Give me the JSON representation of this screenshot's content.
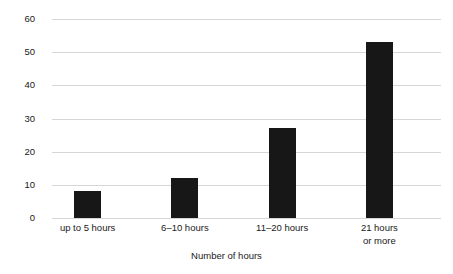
{
  "chart_data": {
    "type": "bar",
    "title": "",
    "subtitle": "",
    "xlabel": "Number of hours",
    "ylabel": "Percentage of students",
    "categories": [
      "up to 5 hours",
      "6–10 hours",
      "11–20 hours",
      "21 hours or more"
    ],
    "category_lines": [
      [
        "up to 5 hours"
      ],
      [
        "6–10 hours"
      ],
      [
        "11–20 hours"
      ],
      [
        "21 hours",
        "or more"
      ]
    ],
    "values": [
      8,
      12,
      27,
      53
    ],
    "ylim": [
      0,
      60
    ],
    "ytick_values": [
      0,
      10,
      20,
      30,
      40,
      50,
      60
    ],
    "ytick_labels": [
      "0",
      "10",
      "20",
      "30",
      "40",
      "50",
      "60"
    ],
    "grid": true,
    "grid_axis": "y",
    "legend": false,
    "legend_position": "none",
    "bar_color": "#171717",
    "gridline_color": "#d6d6d6",
    "background_color": "#ffffff",
    "text_color": "#1a1a1a",
    "data_labels_shown": false,
    "axis_spines_visible": false
  },
  "yticks": [
    {
      "label": "60",
      "value": 60
    },
    {
      "label": "50",
      "value": 50
    },
    {
      "label": "40",
      "value": 40
    },
    {
      "label": "30",
      "value": 30
    },
    {
      "label": "20",
      "value": 20
    },
    {
      "label": "10",
      "value": 10
    },
    {
      "label": "0",
      "value": 0
    }
  ],
  "bars": [
    {
      "line1": "up to 5 hours",
      "line2": "",
      "value": 8
    },
    {
      "line1": "6–10 hours",
      "line2": "",
      "value": 12
    },
    {
      "line1": "11–20 hours",
      "line2": "",
      "value": 27
    },
    {
      "line1": "21 hours",
      "line2": "or more",
      "value": 53
    }
  ],
  "axes": {
    "x_title": "Number of hours",
    "y_title": "Percentage of students"
  }
}
